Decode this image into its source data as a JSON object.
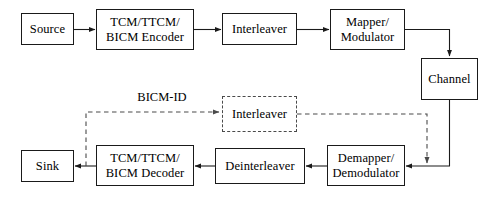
{
  "diagram": {
    "annotation_label": "BICM-ID",
    "stroke_color": "#1a1a1a",
    "dashed_stroke_color": "#4a4a4a",
    "background_color": "#ffffff",
    "nodes": [
      {
        "id": "source",
        "label_lines": [
          "Source"
        ],
        "style": "solid",
        "x": 21,
        "y": 13,
        "w": 53,
        "h": 32
      },
      {
        "id": "encoder",
        "label_lines": [
          "TCM/TTCM/",
          "BICM Encoder"
        ],
        "style": "solid",
        "x": 96,
        "y": 9,
        "w": 98,
        "h": 41
      },
      {
        "id": "interleaver",
        "label_lines": [
          "Interleaver"
        ],
        "style": "solid",
        "x": 222,
        "y": 13,
        "w": 75,
        "h": 32
      },
      {
        "id": "mapper",
        "label_lines": [
          "Mapper/",
          "Modulator"
        ],
        "style": "solid",
        "x": 330,
        "y": 9,
        "w": 75,
        "h": 41
      },
      {
        "id": "channel",
        "label_lines": [
          "Channel"
        ],
        "style": "solid",
        "x": 421,
        "y": 58,
        "w": 57,
        "h": 42
      },
      {
        "id": "fb-interleaver",
        "label_lines": [
          "Interleaver"
        ],
        "style": "dashed",
        "x": 222,
        "y": 96,
        "w": 75,
        "h": 36
      },
      {
        "id": "demapper",
        "label_lines": [
          "Demapper/",
          "Demodulator"
        ],
        "style": "solid",
        "x": 327,
        "y": 145,
        "w": 78,
        "h": 41
      },
      {
        "id": "deinterleaver",
        "label_lines": [
          "Deinterleaver"
        ],
        "style": "solid",
        "x": 215,
        "y": 148,
        "w": 90,
        "h": 36
      },
      {
        "id": "decoder",
        "label_lines": [
          "TCM/TTCM/",
          "BICM Decoder"
        ],
        "style": "solid",
        "x": 96,
        "y": 145,
        "w": 98,
        "h": 41
      },
      {
        "id": "sink",
        "label_lines": [
          "Sink"
        ],
        "style": "solid",
        "x": 21,
        "y": 150,
        "w": 53,
        "h": 32
      }
    ],
    "connections": [
      {
        "id": "source-to-encoder",
        "from": "source",
        "to": "encoder",
        "style": "solid",
        "arrow": true
      },
      {
        "id": "encoder-to-interleaver",
        "from": "encoder",
        "to": "interleaver",
        "style": "solid",
        "arrow": true
      },
      {
        "id": "interleaver-to-mapper",
        "from": "interleaver",
        "to": "mapper",
        "style": "solid",
        "arrow": true
      },
      {
        "id": "mapper-to-channel",
        "from": "mapper",
        "to": "channel",
        "style": "solid",
        "arrow": true
      },
      {
        "id": "channel-to-demapper",
        "from": "channel",
        "to": "demapper",
        "style": "solid",
        "arrow": true
      },
      {
        "id": "demapper-to-deinterleaver",
        "from": "demapper",
        "to": "deinterleaver",
        "style": "solid",
        "arrow": true
      },
      {
        "id": "deinterleaver-to-decoder",
        "from": "deinterleaver",
        "to": "decoder",
        "style": "solid",
        "arrow": true
      },
      {
        "id": "decoder-to-sink",
        "from": "decoder",
        "to": "sink",
        "style": "solid",
        "arrow": true
      },
      {
        "id": "decoder-to-fb-interleaver",
        "from": "decoder",
        "to": "fb-interleaver",
        "style": "dashed",
        "arrow": true
      },
      {
        "id": "fb-interleaver-to-demapper",
        "from": "fb-interleaver",
        "to": "demapper",
        "style": "dashed",
        "arrow": true
      }
    ],
    "annotation_position": {
      "x": 130,
      "y": 90,
      "w": 64
    }
  }
}
